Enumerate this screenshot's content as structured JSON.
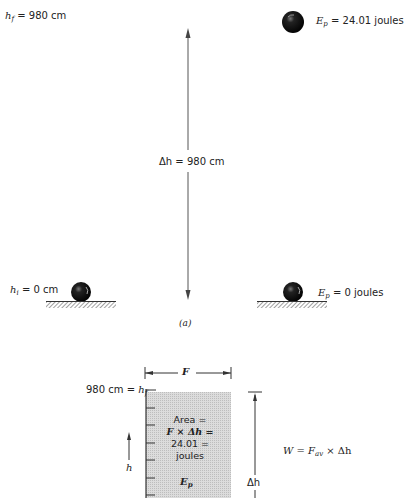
{
  "part_a": {
    "label": "(a)",
    "left": {
      "top_label_var": "h",
      "top_label_sub": "f",
      "top_label_value": "= 980 cm",
      "bottom_label_var": "h",
      "bottom_label_sub": "i",
      "bottom_label_value": "= 0 cm"
    },
    "center": {
      "delta_label": "Δh = 980 cm"
    },
    "right": {
      "top_energy_var": "E",
      "top_energy_sub": "p",
      "top_energy_value": "= 24.01 joules",
      "bottom_energy_var": "E",
      "bottom_energy_sub": "p",
      "bottom_energy_value": "= 0 joules"
    }
  },
  "part_b": {
    "force_label": "F",
    "height_label_value": "980 cm =",
    "height_label_var": "h",
    "height_label_sub": "f",
    "h_arrow_label": "h",
    "area_lines": [
      "Area =",
      "F × Δh =",
      "24.01 =",
      "joules"
    ],
    "area_energy_var": "E",
    "area_energy_sub": "p",
    "delta_h_label": "Δh",
    "work_formula_prefix": "W = F",
    "work_formula_sub": "av",
    "work_formula_suffix": " × Δh"
  },
  "colors": {
    "ink": "#222222",
    "area_fill": "#d4d4d4",
    "hatch": "#444444"
  }
}
